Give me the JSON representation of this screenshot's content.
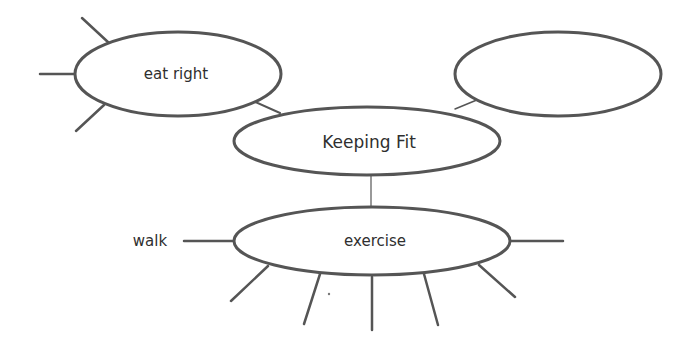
{
  "diagram": {
    "type": "web-organizer",
    "colors": {
      "stroke": "#555555",
      "text": "#2f2f2f",
      "background": "#ffffff"
    },
    "center": {
      "label": "Keeping Fit"
    },
    "nodes": [
      {
        "id": "eat-right",
        "label": "eat right"
      },
      {
        "id": "empty",
        "label": ""
      },
      {
        "id": "exercise",
        "label": "exercise"
      }
    ],
    "branches": {
      "exercise_left": "walk"
    }
  }
}
